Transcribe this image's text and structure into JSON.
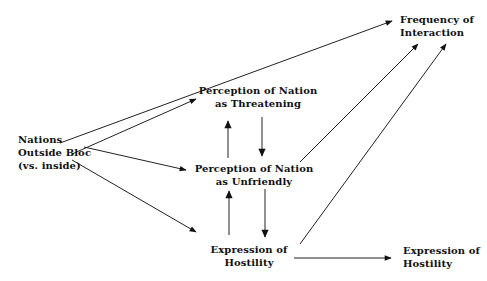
{
  "diagram": {
    "type": "path-diagram",
    "nodes": {
      "nations_outside": {
        "lines": [
          "Nations",
          "Outside Bloc",
          "(vs. inside)"
        ]
      },
      "frequency": {
        "lines": [
          "Frequency of",
          "Interaction"
        ]
      },
      "threatening": {
        "lines": [
          "Perception of Nation",
          "as Threatening"
        ]
      },
      "unfriendly": {
        "lines": [
          "Perception of Nation",
          "as Unfriendly"
        ]
      },
      "hostility_mid": {
        "lines": [
          "Expression of",
          "Hostility"
        ]
      },
      "hostility_out": {
        "lines": [
          "Expression of",
          "Hostility"
        ]
      }
    },
    "edges": [
      {
        "from": "nations_outside",
        "to": "frequency"
      },
      {
        "from": "nations_outside",
        "to": "threatening"
      },
      {
        "from": "nations_outside",
        "to": "unfriendly"
      },
      {
        "from": "nations_outside",
        "to": "hostility_mid"
      },
      {
        "from": "threatening",
        "to": "unfriendly"
      },
      {
        "from": "unfriendly",
        "to": "threatening"
      },
      {
        "from": "unfriendly",
        "to": "hostility_mid"
      },
      {
        "from": "hostility_mid",
        "to": "unfriendly"
      },
      {
        "from": "unfriendly",
        "to": "frequency"
      },
      {
        "from": "hostility_mid",
        "to": "frequency"
      },
      {
        "from": "hostility_mid",
        "to": "hostility_out"
      }
    ]
  }
}
